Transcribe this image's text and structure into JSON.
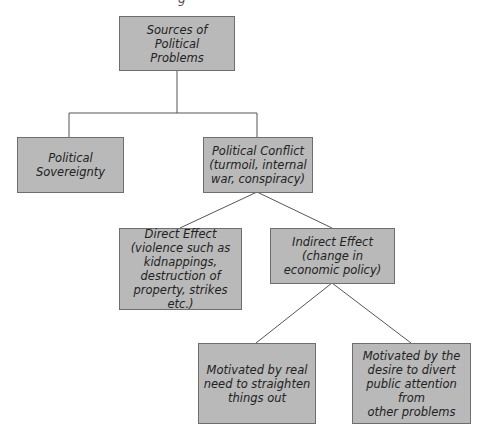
{
  "diagram": {
    "top_fragment": "g",
    "nodes": {
      "root": "Sources of\nPolitical\nProblems",
      "sovereignty": "Political\nSovereignty",
      "conflict": "Political Conflict\n(turmoil, internal\nwar, conspiracy)",
      "direct": "Direct Effect\n(violence such as\nkidnappings,\ndestruction of\nproperty, strikes etc.)",
      "indirect": "Indirect Effect\n(change in\neconomic policy)",
      "real_need": "Motivated by real\nneed to straighten\nthings out",
      "divert": "Motivated by the\ndesire to divert\npublic attention from\nother problems"
    },
    "colors": {
      "box_fill": "#b9b9b9",
      "box_border": "#6e6e6e",
      "line": "#555555"
    }
  }
}
